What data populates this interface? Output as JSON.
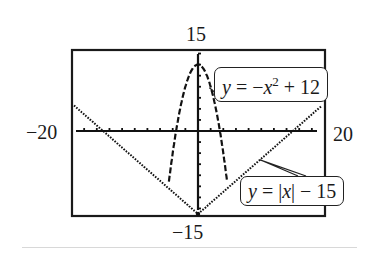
{
  "chart_data": {
    "type": "line",
    "title": "",
    "xlabel": "",
    "ylabel": "",
    "xlim": [
      -20,
      20
    ],
    "ylim": [
      -15,
      15
    ],
    "grid": false,
    "axis_tick_labels": {
      "x_min": "−20",
      "x_max": "20",
      "y_max": "15",
      "y_min": "−15"
    },
    "series": [
      {
        "name": "y = −x² + 12",
        "style": "dashed-dotted (calculator pixel plot)",
        "x": [
          -4,
          -3,
          -2,
          -1,
          0,
          1,
          2,
          3,
          4
        ],
        "y": [
          -4,
          3,
          8,
          11,
          12,
          11,
          8,
          3,
          -4
        ]
      },
      {
        "name": "y = |x| − 15",
        "style": "dotted (calculator pixel plot)",
        "x": [
          -20,
          -15,
          -10,
          -5,
          0,
          5,
          10,
          15,
          20
        ],
        "y": [
          5,
          0,
          -5,
          -10,
          -15,
          -10,
          -5,
          0,
          5
        ]
      }
    ],
    "annotations": [
      {
        "text_parts": [
          "y",
          " = −",
          "x",
          "2",
          " + 12"
        ],
        "points_to": "parabola, right branch near (2, 8)"
      },
      {
        "text_parts": [
          "y",
          " = |",
          "x",
          "| − 15"
        ],
        "points_to": "V-shaped curve, right branch near (10, −5)"
      }
    ],
    "legend_position": "callout boxes at right"
  },
  "labels": {
    "y_max": "15",
    "y_min": "−15",
    "x_min": "−20",
    "x_max": "20"
  },
  "callouts": {
    "parabola": {
      "y": "y",
      "eq": " = −",
      "x": "x",
      "sup": "2",
      "rest": " + 12"
    },
    "absval": {
      "y": "y",
      "eq": " = |",
      "x": "x",
      "rest": "| − 15"
    }
  }
}
